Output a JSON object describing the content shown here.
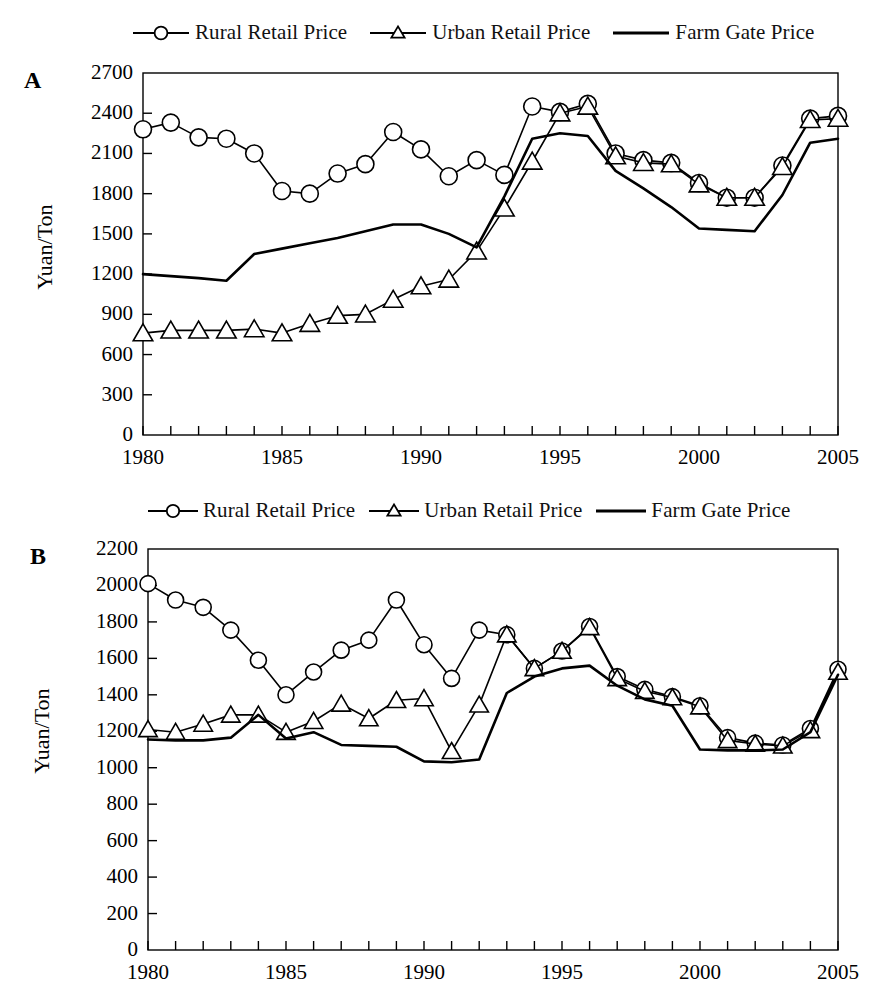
{
  "legend": {
    "items": [
      {
        "label": "Rural Retail Price",
        "marker": "circle-open-marker",
        "style": "line-with-marker"
      },
      {
        "label": "Urban Retail Price",
        "marker": "triangle-open-marker",
        "style": "line-with-marker"
      },
      {
        "label": "Farm Gate Price",
        "marker": "plain-line",
        "style": "line-only"
      }
    ]
  },
  "panels": [
    {
      "letter": "A",
      "ylabel": "Yuan/Ton"
    },
    {
      "letter": "B",
      "ylabel": "Yuan/Ton"
    }
  ],
  "chart_data": [
    {
      "type": "line",
      "panel": "A",
      "title": "",
      "xlabel": "",
      "ylabel": "Yuan/Ton",
      "xlim": [
        1980,
        2005
      ],
      "ylim": [
        0,
        2700
      ],
      "yticks": [
        0,
        300,
        600,
        900,
        1200,
        1500,
        1800,
        2100,
        2400,
        2700
      ],
      "xticks": [
        1980,
        1985,
        1990,
        1995,
        2000,
        2005
      ],
      "xtick_labels": [
        "1980",
        "1985",
        "1990",
        "1995",
        "2000",
        "2005"
      ],
      "ytick_labels": [
        "0",
        "300",
        "600",
        "900",
        "1200",
        "1500",
        "1800",
        "2100",
        "2400",
        "2700"
      ],
      "minor_xticks_every": 1,
      "grid": false,
      "legend_position": "top",
      "x": [
        1980,
        1981,
        1982,
        1983,
        1984,
        1985,
        1986,
        1987,
        1988,
        1989,
        1990,
        1991,
        1992,
        1993,
        1994,
        1995,
        1996,
        1997,
        1998,
        1999,
        2000,
        2001,
        2002,
        2003,
        2004,
        2005
      ],
      "series": [
        {
          "name": "Rural Retail Price",
          "marker": "circle-open-marker",
          "values": [
            2280,
            2330,
            2220,
            2210,
            2100,
            1820,
            1800,
            1950,
            2020,
            2260,
            2130,
            1930,
            2050,
            1940,
            2450,
            2410,
            2470,
            2100,
            2050,
            2030,
            1880,
            1770,
            1770,
            2010,
            2360,
            2380
          ]
        },
        {
          "name": "Urban Retail Price",
          "marker": "triangle-open-marker",
          "values": [
            760,
            780,
            780,
            780,
            790,
            760,
            830,
            890,
            900,
            1010,
            1110,
            1160,
            1370,
            1690,
            2040,
            2400,
            2450,
            2080,
            2030,
            2020,
            1870,
            1770,
            1770,
            2000,
            2350,
            2360
          ]
        },
        {
          "name": "Farm Gate Price",
          "marker": "plain-line",
          "values": [
            1200,
            1185,
            1170,
            1150,
            1350,
            1390,
            1430,
            1470,
            1520,
            1570,
            1570,
            1500,
            1400,
            1780,
            2210,
            2250,
            2230,
            1970,
            1840,
            1700,
            1540,
            1530,
            1520,
            1790,
            2180,
            2210
          ]
        }
      ]
    },
    {
      "type": "line",
      "panel": "B",
      "title": "",
      "xlabel": "",
      "ylabel": "Yuan/Ton",
      "xlim": [
        1980,
        2005
      ],
      "ylim": [
        0,
        2200
      ],
      "yticks": [
        0,
        200,
        400,
        600,
        800,
        1000,
        1200,
        1400,
        1600,
        1800,
        2000,
        2200
      ],
      "xticks": [
        1980,
        1985,
        1990,
        1995,
        2000,
        2005
      ],
      "xtick_labels": [
        "1980",
        "1985",
        "1990",
        "1995",
        "2000",
        "2005"
      ],
      "ytick_labels": [
        "0",
        "200",
        "400",
        "600",
        "800",
        "1000",
        "1200",
        "1400",
        "1600",
        "1800",
        "2000",
        "2200"
      ],
      "minor_xticks_every": 1,
      "grid": false,
      "legend_position": "top",
      "x": [
        1980,
        1981,
        1982,
        1983,
        1984,
        1985,
        1986,
        1987,
        1988,
        1989,
        1990,
        1991,
        1992,
        1993,
        1994,
        1995,
        1996,
        1997,
        1998,
        1999,
        2000,
        2001,
        2002,
        2003,
        2004,
        2005
      ],
      "series": [
        {
          "name": "Rural Retail Price",
          "marker": "circle-open-marker",
          "values": [
            2010,
            1920,
            1880,
            1755,
            1590,
            1400,
            1525,
            1645,
            1700,
            1920,
            1675,
            1490,
            1755,
            1730,
            1545,
            1640,
            1775,
            1500,
            1430,
            1390,
            1340,
            1165,
            1135,
            1125,
            1215,
            1540,
            1475
          ]
        },
        {
          "name": "Urban Retail Price",
          "marker": "triangle-open-marker",
          "values": [
            1210,
            1195,
            1240,
            1290,
            1290,
            1195,
            1255,
            1350,
            1270,
            1370,
            1380,
            1090,
            1345,
            1730,
            1545,
            1640,
            1770,
            1490,
            1420,
            1385,
            1335,
            1150,
            1130,
            1120,
            1205,
            1525,
            1465
          ]
        },
        {
          "name": "Farm Gate Price",
          "marker": "plain-line",
          "values": [
            1155,
            1150,
            1150,
            1165,
            1290,
            1160,
            1195,
            1125,
            1120,
            1115,
            1035,
            1030,
            1045,
            1410,
            1500,
            1545,
            1560,
            1450,
            1375,
            1340,
            1100,
            1095,
            1095,
            1100,
            1195,
            1510,
            1395
          ]
        }
      ]
    }
  ]
}
